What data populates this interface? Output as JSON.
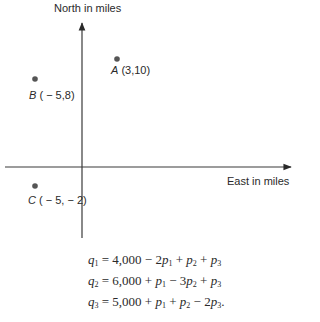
{
  "diagram": {
    "y_axis_label": "North in miles",
    "x_axis_label": "East in miles",
    "points": [
      {
        "name": "A",
        "coords": "(3,10)",
        "x": 3,
        "y": 10
      },
      {
        "name": "B",
        "coords": "( − 5,8)",
        "x": -5,
        "y": 8
      },
      {
        "name": "C",
        "coords": "( − 5, − 2)",
        "x": -5,
        "y": -2
      }
    ],
    "colors": {
      "axis": "#3a3a3a",
      "point": "#555555",
      "text": "#2a2a2a"
    }
  },
  "equations": [
    {
      "lhs_var": "q",
      "lhs_sub": "1",
      "const": "4,000",
      "terms": [
        {
          "op": "−",
          "coef": "2",
          "var": "p",
          "sub": "1"
        },
        {
          "op": "+",
          "coef": "",
          "var": "p",
          "sub": "2"
        },
        {
          "op": "+",
          "coef": "",
          "var": "p",
          "sub": "3"
        }
      ],
      "end": ""
    },
    {
      "lhs_var": "q",
      "lhs_sub": "2",
      "const": "6,000",
      "terms": [
        {
          "op": "+",
          "coef": "",
          "var": "p",
          "sub": "1"
        },
        {
          "op": "−",
          "coef": "3",
          "var": "p",
          "sub": "2"
        },
        {
          "op": "+",
          "coef": "",
          "var": "p",
          "sub": "3"
        }
      ],
      "end": ""
    },
    {
      "lhs_var": "q",
      "lhs_sub": "3",
      "const": "5,000",
      "terms": [
        {
          "op": "+",
          "coef": "",
          "var": "p",
          "sub": "1"
        },
        {
          "op": "+",
          "coef": "",
          "var": "p",
          "sub": "2"
        },
        {
          "op": "−",
          "coef": "2",
          "var": "p",
          "sub": "3"
        }
      ],
      "end": "."
    }
  ]
}
